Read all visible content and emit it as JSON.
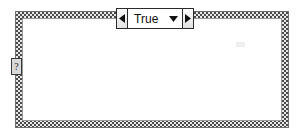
{
  "diagram": {
    "kind": "labview-case-structure",
    "frame": {
      "border_style": "dithered-checkerboard",
      "border_color": "#4a4a4a",
      "border_highlight": "#e8e8e8",
      "interior_color": "#ffffff",
      "outline_color": "#6e6e6e"
    },
    "selector_label": {
      "value": "True",
      "prev_case_icon": "left-triangle-icon",
      "next_case_icon": "right-triangle-icon",
      "dropdown_icon": "chevron-down-icon",
      "background": "#ffffff",
      "border_color": "#2b2b2b"
    },
    "selector_terminal": {
      "glyph": "?",
      "name": "case-selector-terminal",
      "fill": "#d9d9d9",
      "border_color": "#3a3a3a"
    },
    "contents": []
  }
}
